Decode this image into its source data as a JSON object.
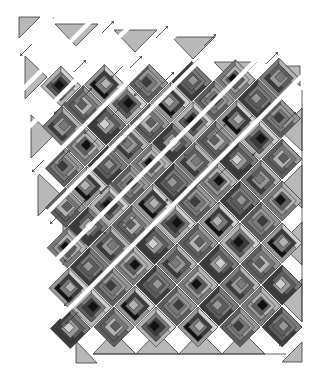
{
  "diagram": {
    "title": "",
    "width": 322,
    "height": 378,
    "background": "#ffffff",
    "colors": {
      "triangle": "#b8b8b8",
      "outline": "#2e2e2e",
      "arrow": "#444444",
      "shades": [
        "#111111",
        "#3c3c3c",
        "#5e5e5e",
        "#7a7a7a",
        "#979797",
        "#b3b3b3",
        "#cfcfcf"
      ]
    },
    "grid": {
      "origin_x": 30,
      "origin_y": 12,
      "cell": 21,
      "block_half_diag": 20
    },
    "rows_note": "Each diagonal strip runs from upper-right to lower-left. Upper-left strips are shown separated with gaps; lower-right area shows strips joined.",
    "strips": [
      {
        "id": 1,
        "blocks": [
          [
            2,
            3
          ]
        ],
        "gap": 1
      },
      {
        "id": 2,
        "blocks": [
          [
            4,
            3
          ],
          [
            3,
            4
          ],
          [
            2,
            5
          ]
        ],
        "gap": 1
      },
      {
        "id": 3,
        "blocks": [
          [
            6,
            3
          ],
          [
            5,
            4
          ],
          [
            4,
            5
          ],
          [
            3,
            6
          ],
          [
            2,
            7
          ]
        ],
        "gap": 1
      },
      {
        "id": 4,
        "blocks": [
          [
            8,
            3
          ],
          [
            7,
            4
          ],
          [
            6,
            5
          ],
          [
            5,
            6
          ],
          [
            4,
            7
          ],
          [
            3,
            8
          ],
          [
            2,
            9
          ]
        ],
        "gap": 1
      },
      {
        "id": 5,
        "blocks": [
          [
            10,
            3
          ],
          [
            9,
            4
          ],
          [
            8,
            5
          ],
          [
            7,
            6
          ],
          [
            6,
            7
          ],
          [
            5,
            8
          ],
          [
            4,
            9
          ],
          [
            3,
            10
          ],
          [
            2,
            11
          ]
        ],
        "gap": 1
      },
      {
        "id": 6,
        "blocks": [
          [
            12,
            3
          ],
          [
            11,
            4
          ],
          [
            10,
            5
          ],
          [
            9,
            6
          ],
          [
            8,
            7
          ],
          [
            7,
            8
          ],
          [
            6,
            9
          ],
          [
            5,
            10
          ],
          [
            4,
            11
          ],
          [
            3,
            12
          ],
          [
            2,
            13
          ]
        ],
        "gap": 1
      },
      {
        "id": 7,
        "blocks": [
          [
            12,
            5
          ],
          [
            11,
            6
          ],
          [
            10,
            7
          ],
          [
            9,
            8
          ],
          [
            8,
            9
          ],
          [
            7,
            10
          ],
          [
            6,
            11
          ],
          [
            5,
            12
          ],
          [
            4,
            13
          ],
          [
            3,
            14
          ],
          [
            2,
            15
          ]
        ],
        "gap": 1
      },
      {
        "id": 8,
        "blocks": [
          [
            12,
            7
          ],
          [
            11,
            8
          ],
          [
            10,
            9
          ],
          [
            9,
            10
          ],
          [
            8,
            11
          ],
          [
            7,
            12
          ],
          [
            6,
            13
          ],
          [
            5,
            14
          ],
          [
            4,
            15
          ]
        ],
        "gap": 0
      },
      {
        "id": 9,
        "blocks": [
          [
            12,
            9
          ],
          [
            11,
            10
          ],
          [
            10,
            11
          ],
          [
            9,
            12
          ],
          [
            8,
            13
          ],
          [
            7,
            14
          ],
          [
            6,
            15
          ]
        ],
        "gap": 0
      },
      {
        "id": 10,
        "blocks": [
          [
            12,
            11
          ],
          [
            11,
            12
          ],
          [
            10,
            13
          ],
          [
            9,
            14
          ],
          [
            8,
            15
          ]
        ],
        "gap": 0
      },
      {
        "id": 11,
        "blocks": [
          [
            12,
            13
          ],
          [
            11,
            14
          ],
          [
            10,
            15
          ]
        ],
        "gap": 0
      },
      {
        "id": 12,
        "blocks": [
          [
            12,
            15
          ]
        ],
        "gap": 0
      }
    ],
    "block_styles": [
      {
        "center": 3,
        "ring1": 4,
        "ring2": 2,
        "ring3": 3
      },
      {
        "center": 0,
        "ring1": 2,
        "ring2": 5,
        "ring3": 3
      },
      {
        "center": 4,
        "ring1": 2,
        "ring2": 3,
        "ring3": 1
      },
      {
        "center": 1,
        "ring1": 3,
        "ring2": 4,
        "ring3": 2
      },
      {
        "center": 5,
        "ring1": 3,
        "ring2": 1,
        "ring3": 4
      },
      {
        "center": 0,
        "ring1": 1,
        "ring2": 3,
        "ring3": 5
      },
      {
        "center": 2,
        "ring1": 5,
        "ring2": 3,
        "ring3": 2
      },
      {
        "center": 6,
        "ring1": 4,
        "ring2": 2,
        "ring3": 1
      }
    ],
    "setting_triangles": "auto",
    "arrows": "auto"
  }
}
